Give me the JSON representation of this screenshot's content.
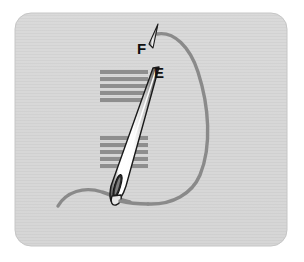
{
  "figure": {
    "name": "embroidery-stitch-diagram",
    "panel": {
      "x": 15,
      "y": 13,
      "width": 272,
      "height": 233,
      "corner_radius": 16,
      "fill": "#d6d6d6",
      "texture": "horizontal-scanlines"
    },
    "background": "#ffffff"
  },
  "labels": [
    {
      "id": "F",
      "text": "F",
      "x": 137,
      "y": 41,
      "color": "#111111"
    },
    {
      "id": "E",
      "text": "E",
      "x": 154,
      "y": 65,
      "color": "#111111"
    }
  ],
  "colors": {
    "panel_fill": "#d6d6d6",
    "panel_texture": "#cdcdcd",
    "stitch_bar": "#8e8e8e",
    "thread": "#8a8a8a",
    "needle_body": "#f2f2f2",
    "needle_outline": "#1a1a1a",
    "label": "#111111",
    "page_background": "#ffffff"
  },
  "stitch_bars": {
    "upper_group": {
      "count": 5,
      "x": 100,
      "width": 48,
      "height": 4,
      "y_start": 70,
      "spacing": 7
    },
    "lower_group": {
      "count": 5,
      "x": 100,
      "width": 48,
      "height": 4,
      "y_start": 136,
      "spacing": 7
    }
  },
  "needle": {
    "name": "sewing-needle",
    "tip_point": {
      "x": 158,
      "y": 68
    },
    "eye_point": {
      "x": 120,
      "y": 200
    },
    "angle_deg": 18,
    "length": 137
  },
  "needle_tip_marker": {
    "name": "needle-tip-at-F",
    "x": 155,
    "y": 25,
    "height": 24
  },
  "thread": {
    "name": "thread-loop",
    "loop_from": "F",
    "loop_to": "needle-eye",
    "tail_end": {
      "x": 58,
      "y": 205
    },
    "stroke_width": 3.2
  }
}
